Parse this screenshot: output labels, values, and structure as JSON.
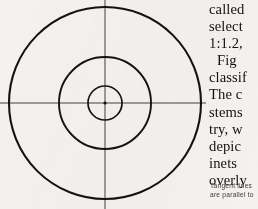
{
  "page": {
    "background_color": "#f3f2ef",
    "width": 258,
    "height": 209
  },
  "figure": {
    "name": "concentric-circles-target-diagram",
    "ink_color": "#16130f",
    "axis_color": "#7d7b78",
    "center": {
      "x": 105,
      "y": 103
    },
    "center_dot_label": "center point",
    "circles": [
      {
        "label": "inner-circle",
        "radius": 17,
        "stroke_width": 1.7
      },
      {
        "label": "middle-circle",
        "radius": 46,
        "stroke_width": 1.9
      },
      {
        "label": "outer-circle",
        "radius": 96,
        "stroke_width": 2.1
      }
    ],
    "axes": [
      {
        "label": "horizontal-axis",
        "from_x": 0,
        "to_x": 206,
        "y": 103
      },
      {
        "label": "vertical-axis",
        "x": 105,
        "from_y": 0,
        "to_y": 209
      }
    ]
  },
  "text_column": {
    "body_lines": [
      "called",
      "select",
      "1:1.2,",
      "Fig",
      "classif",
      "The c",
      "stems",
      "try, w",
      "depic",
      "inets",
      "overly"
    ],
    "indented_line_index": 3,
    "caption_lines": [
      "Tangent lines",
      "are parallel to"
    ]
  }
}
